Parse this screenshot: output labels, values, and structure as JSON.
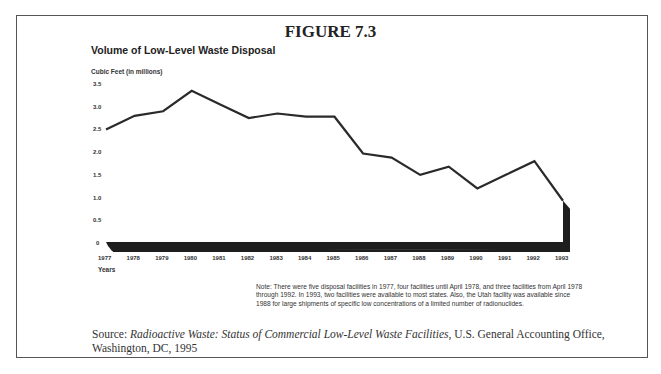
{
  "figure": {
    "label": "FIGURE 7.3",
    "note": "Note: There were five disposal facilities in 1977, four facilities until April 1978, and three facilities from April 1978 through 1992. In 1993, two facilities were available to most states. Also, the Utah facility was available since 1988 for large shipments of specific low concentrations of a limited number of radionuclides.",
    "source_prefix": "Source: ",
    "source_title": "Radioactive Waste: Status of Commercial Low-Level Waste Facilities",
    "source_suffix": ", U.S. General Accounting Office, Washington, DC, 1995"
  },
  "chart_data": {
    "type": "line",
    "title": "Volume of Low-Level Waste Disposal",
    "ylabel": "Cubic Feet (in millions)",
    "xlabel": "Years",
    "x": [
      "1977",
      "1978",
      "1979",
      "1980",
      "1981",
      "1982",
      "1983",
      "1984",
      "1985",
      "1986",
      "1987",
      "1988",
      "1989",
      "1990",
      "1991",
      "1992",
      "1993"
    ],
    "series": [
      {
        "name": "Volume",
        "values": [
          2.5,
          2.8,
          2.9,
          3.35,
          3.05,
          2.75,
          2.85,
          2.78,
          2.78,
          1.97,
          1.88,
          1.5,
          1.68,
          1.2,
          1.5,
          1.8,
          0.93
        ]
      }
    ],
    "yticks": [
      "0",
      "0.5",
      "1.0",
      "1.5",
      "2.0",
      "2.5",
      "3.0",
      "3.5"
    ],
    "ytick_values": [
      0,
      0.5,
      1.0,
      1.5,
      2.0,
      2.5,
      3.0,
      3.5
    ],
    "ylim": [
      0,
      3.5
    ],
    "grid": false,
    "legend": "none",
    "line_color": "#2a2a2a",
    "base_color": "#1e1e1e"
  }
}
